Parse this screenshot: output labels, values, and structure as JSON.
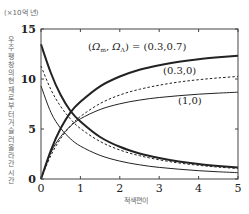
{
  "chart_data": {
    "type": "line",
    "title": "",
    "unit_label": "(×10억 년)",
    "xlabel": "적색편이",
    "ylabel": "우주팽창의 현재로부터 거슬러 올라간 시간",
    "xlim": [
      0,
      5
    ],
    "ylim": [
      0,
      15
    ],
    "x_ticks": [
      0,
      1,
      2,
      3,
      4,
      5
    ],
    "y_ticks": [
      0,
      5,
      10,
      15
    ],
    "grid": false,
    "x": [
      0,
      0.25,
      0.5,
      0.75,
      1,
      1.5,
      2,
      2.5,
      3,
      3.5,
      4,
      4.5,
      5
    ],
    "series": [
      {
        "name": "(Ω_m, Ω_Λ) = (0.3,0.7) lookback",
        "style": "thick-solid",
        "values": [
          0,
          2.87,
          5.07,
          6.67,
          7.72,
          9.27,
          10.25,
          10.92,
          11.37,
          11.72,
          11.97,
          12.17,
          12.32
        ]
      },
      {
        "name": "(Ω_m, Ω_Λ) = (0.3,0.7) age",
        "style": "thick-solid",
        "values": [
          13.47,
          10.6,
          8.4,
          6.8,
          5.75,
          4.2,
          3.22,
          2.55,
          2.1,
          1.75,
          1.5,
          1.3,
          1.15
        ]
      },
      {
        "name": "(0.3,0) lookback",
        "style": "dashed",
        "values": [
          0,
          2.35,
          4.05,
          5.3,
          6.25,
          7.55,
          8.4,
          8.97,
          9.38,
          9.7,
          9.93,
          10.11,
          10.26
        ]
      },
      {
        "name": "(0.3,0) age",
        "style": "dashed",
        "values": [
          11.3,
          8.95,
          7.25,
          6.0,
          5.05,
          3.75,
          2.9,
          2.33,
          1.92,
          1.6,
          1.37,
          1.19,
          1.04
        ]
      },
      {
        "name": "(1,0) lookback",
        "style": "thin-solid",
        "values": [
          0,
          2.65,
          4.24,
          5.29,
          6.02,
          6.95,
          7.52,
          7.89,
          8.15,
          8.33,
          8.48,
          8.59,
          8.68
        ]
      },
      {
        "name": "(1,0) age",
        "style": "thin-solid",
        "values": [
          9.31,
          6.66,
          5.07,
          4.02,
          3.29,
          2.36,
          1.79,
          1.42,
          1.16,
          0.98,
          0.83,
          0.72,
          0.63
        ]
      }
    ],
    "legend": {
      "position": "inline",
      "entries": [
        "(Ω_m, Ω_Λ) = (0.3,0.7)",
        "(0.3,0)",
        "(1,0)"
      ]
    }
  },
  "labels": {
    "unit": "(×10억 년)",
    "ylabel": "우주팽창의 현재로부터 거슬러 올라간 시간",
    "xlabel": "적색편이",
    "legend_main": "(Ω_m, Ω_Λ) = (0.3,0.7)",
    "legend_dashed": "(0.3,0)",
    "legend_thin": "(1,0)",
    "xticks": [
      "0",
      "1",
      "2",
      "3",
      "4",
      "5"
    ],
    "yticks": [
      "0",
      "5",
      "10",
      "15"
    ]
  },
  "colors": {
    "line": "#222222",
    "axis": "#444444",
    "label": "#666666"
  }
}
